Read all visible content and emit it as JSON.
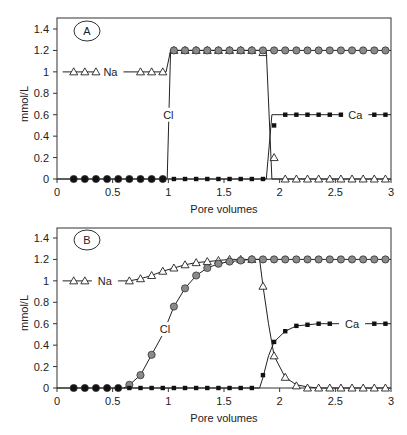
{
  "chart_data": [
    {
      "type": "line",
      "panel_label": "A",
      "xlabel": "Pore volumes",
      "ylabel": "mmol/L",
      "xlim": [
        0,
        3
      ],
      "ylim": [
        0,
        1.4
      ],
      "xticks": [
        "0",
        "0.5",
        "1",
        "1.5",
        "2",
        "2.5",
        "3"
      ],
      "yticks": [
        "0",
        "0.2",
        "0.4",
        "0.6",
        "0.8",
        "1",
        "1.2",
        "1.4"
      ],
      "grid": false,
      "series": [
        {
          "name": "Na",
          "marker": "open-triangle",
          "label_pos": [
            0.48,
            1.0
          ],
          "line": [
            [
              0.05,
              1.0
            ],
            [
              0.98,
              1.0
            ],
            [
              1.02,
              1.2
            ],
            [
              1.88,
              1.2
            ],
            [
              1.93,
              0.0
            ],
            [
              3.0,
              0.0
            ]
          ],
          "points": [
            [
              0.15,
              1.0
            ],
            [
              0.25,
              1.0
            ],
            [
              0.35,
              1.0
            ],
            [
              0.75,
              1.0
            ],
            [
              0.85,
              1.0
            ],
            [
              0.95,
              1.0
            ],
            [
              1.05,
              1.2
            ],
            [
              1.15,
              1.2
            ],
            [
              1.25,
              1.2
            ],
            [
              1.35,
              1.2
            ],
            [
              1.45,
              1.2
            ],
            [
              1.55,
              1.2
            ],
            [
              1.65,
              1.2
            ],
            [
              1.75,
              1.2
            ],
            [
              1.85,
              1.18
            ],
            [
              1.95,
              0.2
            ],
            [
              2.05,
              0.0
            ],
            [
              2.15,
              0.0
            ],
            [
              2.25,
              0.0
            ],
            [
              2.35,
              0.0
            ],
            [
              2.45,
              0.0
            ],
            [
              2.55,
              0.0
            ],
            [
              2.65,
              0.0
            ],
            [
              2.75,
              0.0
            ],
            [
              2.85,
              0.0
            ],
            [
              2.95,
              0.0
            ]
          ]
        },
        {
          "name": "Cl",
          "marker": "filled-circle",
          "label_pos": [
            1.0,
            0.6
          ],
          "line": [
            [
              0.0,
              0.0
            ],
            [
              0.99,
              0.0
            ],
            [
              1.02,
              1.2
            ],
            [
              3.0,
              1.2
            ]
          ],
          "points": [
            [
              0.15,
              0.0
            ],
            [
              0.25,
              0.0
            ],
            [
              0.35,
              0.0
            ],
            [
              0.45,
              0.0
            ],
            [
              0.55,
              0.0
            ],
            [
              0.65,
              0.0
            ],
            [
              0.75,
              0.0
            ],
            [
              0.85,
              0.0
            ],
            [
              0.95,
              0.0
            ],
            [
              1.05,
              1.2
            ],
            [
              1.15,
              1.2
            ],
            [
              1.25,
              1.2
            ],
            [
              1.35,
              1.2
            ],
            [
              1.45,
              1.2
            ],
            [
              1.55,
              1.2
            ],
            [
              1.65,
              1.2
            ],
            [
              1.75,
              1.2
            ],
            [
              1.85,
              1.2
            ],
            [
              1.95,
              1.2
            ],
            [
              2.05,
              1.2
            ],
            [
              2.15,
              1.2
            ],
            [
              2.25,
              1.2
            ],
            [
              2.35,
              1.2
            ],
            [
              2.45,
              1.2
            ],
            [
              2.55,
              1.2
            ],
            [
              2.65,
              1.2
            ],
            [
              2.75,
              1.2
            ],
            [
              2.85,
              1.2
            ],
            [
              2.95,
              1.2
            ]
          ]
        },
        {
          "name": "Ca",
          "marker": "filled-square",
          "label_pos": [
            2.68,
            0.6
          ],
          "line": [
            [
              1.0,
              0.0
            ],
            [
              1.88,
              0.0
            ],
            [
              1.93,
              0.6
            ],
            [
              3.0,
              0.6
            ]
          ],
          "points": [
            [
              1.05,
              0.0
            ],
            [
              1.15,
              0.0
            ],
            [
              1.25,
              0.0
            ],
            [
              1.35,
              0.0
            ],
            [
              1.45,
              0.0
            ],
            [
              1.55,
              0.0
            ],
            [
              1.65,
              0.0
            ],
            [
              1.75,
              0.0
            ],
            [
              1.85,
              0.0
            ],
            [
              1.95,
              0.5
            ],
            [
              2.05,
              0.6
            ],
            [
              2.15,
              0.6
            ],
            [
              2.25,
              0.6
            ],
            [
              2.35,
              0.6
            ],
            [
              2.45,
              0.6
            ],
            [
              2.55,
              0.6
            ],
            [
              2.85,
              0.6
            ],
            [
              2.95,
              0.6
            ]
          ]
        }
      ]
    },
    {
      "type": "line",
      "panel_label": "B",
      "xlabel": "Pore volumes",
      "ylabel": "mmol/L",
      "xlim": [
        0,
        3
      ],
      "ylim": [
        0,
        1.4
      ],
      "xticks": [
        "0",
        "0.5",
        "1",
        "1.5",
        "2",
        "2.5",
        "3"
      ],
      "yticks": [
        "0",
        "0.2",
        "0.4",
        "0.6",
        "0.8",
        "1",
        "1.2",
        "1.4"
      ],
      "grid": false,
      "series": [
        {
          "name": "Na",
          "marker": "open-triangle",
          "label_pos": [
            0.43,
            1.0
          ],
          "line": [
            [
              0.05,
              1.0
            ],
            [
              0.55,
              1.0
            ],
            [
              0.65,
              1.0
            ],
            [
              0.75,
              1.02
            ],
            [
              0.85,
              1.05
            ],
            [
              0.95,
              1.09
            ],
            [
              1.05,
              1.12
            ],
            [
              1.15,
              1.15
            ],
            [
              1.25,
              1.17
            ],
            [
              1.35,
              1.18
            ],
            [
              1.45,
              1.19
            ],
            [
              1.55,
              1.2
            ],
            [
              1.65,
              1.2
            ],
            [
              1.75,
              1.2
            ],
            [
              1.82,
              1.2
            ],
            [
              1.85,
              0.95
            ],
            [
              1.9,
              0.6
            ],
            [
              1.95,
              0.3
            ],
            [
              2.05,
              0.1
            ],
            [
              2.15,
              0.03
            ],
            [
              2.25,
              0.01
            ],
            [
              2.35,
              0.0
            ],
            [
              3.0,
              0.0
            ]
          ],
          "points": [
            [
              0.15,
              1.0
            ],
            [
              0.25,
              1.0
            ],
            [
              0.65,
              1.0
            ],
            [
              0.75,
              1.02
            ],
            [
              0.85,
              1.05
            ],
            [
              0.95,
              1.09
            ],
            [
              1.05,
              1.12
            ],
            [
              1.15,
              1.15
            ],
            [
              1.25,
              1.17
            ],
            [
              1.35,
              1.18
            ],
            [
              1.45,
              1.19
            ],
            [
              1.55,
              1.2
            ],
            [
              1.65,
              1.2
            ],
            [
              1.75,
              1.2
            ],
            [
              1.85,
              0.95
            ],
            [
              1.95,
              0.3
            ],
            [
              2.05,
              0.1
            ],
            [
              2.15,
              0.02
            ],
            [
              2.25,
              0.0
            ],
            [
              2.35,
              0.0
            ],
            [
              2.45,
              0.0
            ],
            [
              2.55,
              0.0
            ],
            [
              2.65,
              0.0
            ],
            [
              2.75,
              0.0
            ],
            [
              2.85,
              0.0
            ],
            [
              2.95,
              0.0
            ]
          ]
        },
        {
          "name": "Cl",
          "marker": "filled-circle",
          "label_pos": [
            0.97,
            0.55
          ],
          "line": [
            [
              0.0,
              0.0
            ],
            [
              0.6,
              0.0
            ],
            [
              0.65,
              0.03
            ],
            [
              0.75,
              0.12
            ],
            [
              0.85,
              0.31
            ],
            [
              0.95,
              0.5
            ],
            [
              1.05,
              0.76
            ],
            [
              1.15,
              0.93
            ],
            [
              1.25,
              1.05
            ],
            [
              1.35,
              1.12
            ],
            [
              1.45,
              1.16
            ],
            [
              1.55,
              1.18
            ],
            [
              1.65,
              1.19
            ],
            [
              1.75,
              1.2
            ],
            [
              3.0,
              1.2
            ]
          ],
          "points": [
            [
              0.15,
              0.0
            ],
            [
              0.25,
              0.0
            ],
            [
              0.35,
              0.0
            ],
            [
              0.45,
              0.0
            ],
            [
              0.55,
              0.0
            ],
            [
              0.65,
              0.03
            ],
            [
              0.75,
              0.12
            ],
            [
              0.85,
              0.31
            ],
            [
              1.05,
              0.76
            ],
            [
              1.15,
              0.93
            ],
            [
              1.25,
              1.05
            ],
            [
              1.35,
              1.12
            ],
            [
              1.45,
              1.16
            ],
            [
              1.55,
              1.18
            ],
            [
              1.65,
              1.19
            ],
            [
              1.75,
              1.2
            ],
            [
              1.85,
              1.2
            ],
            [
              1.95,
              1.2
            ],
            [
              2.05,
              1.2
            ],
            [
              2.15,
              1.2
            ],
            [
              2.25,
              1.2
            ],
            [
              2.35,
              1.2
            ],
            [
              2.45,
              1.2
            ],
            [
              2.55,
              1.2
            ],
            [
              2.65,
              1.2
            ],
            [
              2.75,
              1.2
            ],
            [
              2.85,
              1.2
            ],
            [
              2.95,
              1.2
            ]
          ]
        },
        {
          "name": "Ca",
          "marker": "filled-square",
          "label_pos": [
            2.65,
            0.6
          ],
          "line": [
            [
              0.6,
              0.0
            ],
            [
              1.82,
              0.0
            ],
            [
              1.85,
              0.1
            ],
            [
              1.9,
              0.3
            ],
            [
              1.95,
              0.43
            ],
            [
              2.05,
              0.53
            ],
            [
              2.15,
              0.58
            ],
            [
              2.25,
              0.59
            ],
            [
              2.35,
              0.6
            ],
            [
              3.0,
              0.6
            ]
          ],
          "points": [
            [
              0.65,
              0.0
            ],
            [
              0.75,
              0.0
            ],
            [
              0.85,
              0.0
            ],
            [
              0.95,
              0.0
            ],
            [
              1.05,
              0.0
            ],
            [
              1.15,
              0.0
            ],
            [
              1.25,
              0.0
            ],
            [
              1.35,
              0.0
            ],
            [
              1.45,
              0.0
            ],
            [
              1.55,
              0.0
            ],
            [
              1.65,
              0.0
            ],
            [
              1.75,
              0.0
            ],
            [
              1.85,
              0.12
            ],
            [
              1.95,
              0.43
            ],
            [
              2.05,
              0.53
            ],
            [
              2.15,
              0.58
            ],
            [
              2.25,
              0.59
            ],
            [
              2.35,
              0.6
            ],
            [
              2.45,
              0.6
            ],
            [
              2.85,
              0.6
            ],
            [
              2.95,
              0.6
            ]
          ]
        }
      ]
    }
  ],
  "colors": {
    "axis": "#333333",
    "line": "#222222",
    "cl_marker_fill": "#8a8a8a",
    "cl_marker_fill_black": "#111111",
    "ca_marker_fill": "#111111",
    "na_marker_fill": "#ffffff"
  }
}
